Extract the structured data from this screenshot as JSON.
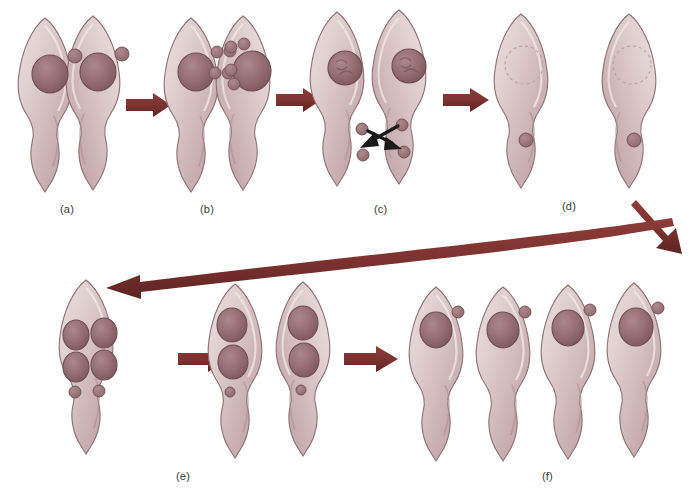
{
  "figure": {
    "background_color": "#ffffff",
    "label_color": "#3a3a3a"
  },
  "palette": {
    "arrow_maroon": "#7d3330",
    "arrow_maroon_dark": "#5e2422",
    "arrow_black": "#1a1a1a",
    "cell_body_light": "#e3d3d3",
    "cell_body_mid": "#cdb3b4",
    "cell_body_shadow": "#b59a9c",
    "cell_outline": "#8d7072",
    "nucleus_fill": "#9b7478",
    "nucleus_dark": "#8a6367",
    "nucleus_outline": "#6f4e52",
    "small_body_fill": "#a57d80",
    "ghost_nucleus_outline": "#bda5a7"
  },
  "panels": [
    {
      "id": "a",
      "label": "(a)",
      "label_x": 60,
      "label_x_css": 60,
      "label_y": 203,
      "caption_stage": "Paired trophozoites, each with one large nucleus and one small body",
      "cell_count": 2,
      "nuclei_per_cell": 1,
      "small_bodies_per_cell": 1
    },
    {
      "id": "b",
      "label": "(b)",
      "label_x": 200,
      "label_x_css": 200,
      "label_y": 203,
      "caption_stage": "Small bodies replicate into clusters of four beside each nucleus",
      "cell_count": 2,
      "nuclei_per_cell": 1,
      "small_bodies_per_cell": 4
    },
    {
      "id": "c",
      "label": "(c)",
      "label_x": 374,
      "label_x_css": 374,
      "label_y": 203,
      "caption_stage": "Nuclei condense; small bodies migrate across, shown by crossing arrows",
      "cell_count": 2,
      "nuclei_per_cell": 1,
      "small_bodies_per_cell": 2,
      "migration_arrows": 2
    },
    {
      "id": "d",
      "label": "(d)",
      "label_x": 562,
      "label_x_css": 562,
      "label_y": 200,
      "caption_stage": "Nuclear material disperses; faint nuclear ghost and one small body remain",
      "cell_count": 2,
      "nuclei_per_cell": 0,
      "small_bodies_per_cell": 1
    },
    {
      "id": "e",
      "label": "(e)",
      "label_x": 176,
      "label_x_css": 176,
      "label_y": 470,
      "caption_stage": "Single cell with four reformed nuclei and two small bodies, then splitting into two",
      "cell_count": 3,
      "nuclei_first_cell": 4,
      "small_bodies_first_cell": 2,
      "nuclei_per_daughter": 2,
      "small_bodies_per_daughter": 1
    },
    {
      "id": "f",
      "label": "(f)",
      "label_x": 542,
      "label_x_css": 542,
      "label_y": 470,
      "caption_stage": "Four separate daughter trophozoites, each with one nucleus and one small body",
      "cell_count": 4,
      "nuclei_per_cell": 1,
      "small_bodies_per_cell": 1
    }
  ],
  "arrows": [
    {
      "id": "a-to-b",
      "type": "straight-right",
      "from": "a",
      "to": "b",
      "color": "#7d3330"
    },
    {
      "id": "b-to-c",
      "type": "straight-right",
      "from": "b",
      "to": "c",
      "color": "#7d3330"
    },
    {
      "id": "c-to-d",
      "type": "straight-right",
      "from": "c",
      "to": "d",
      "color": "#7d3330"
    },
    {
      "id": "d-to-wrap",
      "type": "diagonal-down-right",
      "from": "d",
      "to": "wrap",
      "color": "#7d3330"
    },
    {
      "id": "wrap-to-e",
      "type": "curved-left",
      "from": "wrap",
      "to": "e",
      "color": "#7d3330"
    },
    {
      "id": "e-to-e2",
      "type": "straight-right",
      "from": "e",
      "to": "e-daughters",
      "color": "#7d3330"
    },
    {
      "id": "e2-to-f",
      "type": "straight-right",
      "from": "e-daughters",
      "to": "f",
      "color": "#7d3330"
    },
    {
      "id": "c-migration-1",
      "type": "black-migration",
      "from": "c-upper-right",
      "to": "c-lower-left",
      "color": "#1a1a1a"
    },
    {
      "id": "c-migration-2",
      "type": "black-migration",
      "from": "c-upper-left",
      "to": "c-lower-right",
      "color": "#1a1a1a"
    }
  ]
}
